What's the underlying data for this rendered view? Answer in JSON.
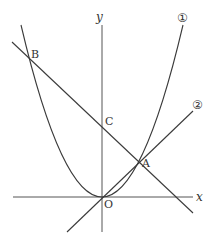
{
  "diagram": {
    "axes": {
      "x_label": "x",
      "y_label": "y",
      "origin_label": "O"
    },
    "curves": [
      {
        "id": "1",
        "label": "①",
        "type": "parabola",
        "description": "y = a x^2 through O, A, B"
      },
      {
        "id": "2",
        "label": "②",
        "type": "line",
        "description": "line through O and A"
      }
    ],
    "line_ab": {
      "description": "line through B, C, A"
    },
    "points": {
      "A": "A",
      "B": "B",
      "C": "C",
      "O": "O"
    },
    "colors": {
      "stroke": "#3a3a3a",
      "background": "#ffffff"
    }
  }
}
